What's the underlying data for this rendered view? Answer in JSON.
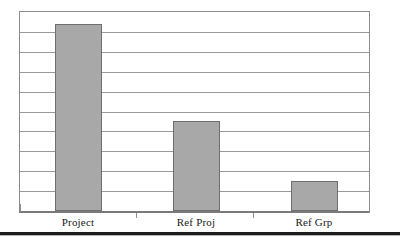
{
  "chart_data": {
    "type": "bar",
    "title": "",
    "subtitle": "",
    "xlabel": "",
    "ylabel": "",
    "categories": [
      "Project",
      "Ref Proj",
      "Ref Grp"
    ],
    "values": [
      9.4,
      4.5,
      1.5
    ],
    "ylim": [
      0,
      10
    ],
    "grid": true,
    "gridline_count": 9,
    "legend": "none",
    "y_tick_labels": [],
    "bar_color": "#a8a8a8",
    "bar_border_color": "#6e6e6e",
    "gridline_color": "#9a9a9a",
    "frame_color": "#8c8c8c",
    "background_color": "#ffffff",
    "label_color": "#1a1a1a",
    "rule_color": "#1c1c1c"
  },
  "labels": {
    "project": "Project",
    "ref_proj": "Ref Proj",
    "ref_grp": "Ref Grp"
  }
}
